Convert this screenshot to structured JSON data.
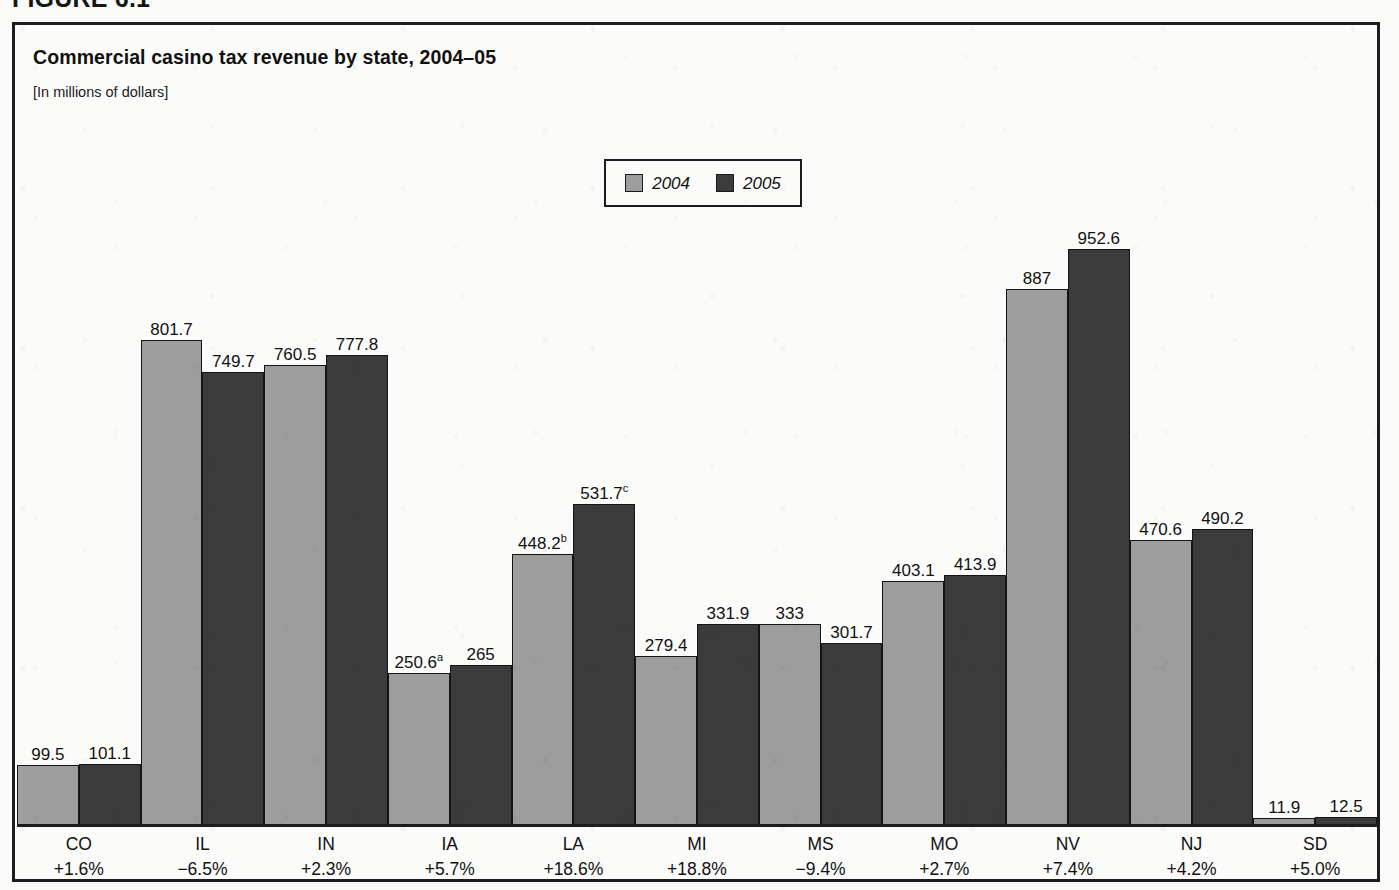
{
  "figure": {
    "label": "FIGURE 6.1"
  },
  "header": {
    "title": "Commercial casino tax revenue by state, 2004–05",
    "subtitle": "[In millions of dollars]"
  },
  "legend": {
    "entries": [
      {
        "label": "2004",
        "color": "#9d9d9d",
        "swatch_name": "legend-swatch-2004"
      },
      {
        "label": "2005",
        "color": "#3b3b3b",
        "swatch_name": "legend-swatch-2005"
      }
    ]
  },
  "chart_data": {
    "type": "bar",
    "title": "Commercial casino tax revenue by state, 2004–05",
    "subtitle": "[In millions of dollars]",
    "xlabel": "",
    "ylabel": "In millions of dollars",
    "ylim": [
      0,
      1000
    ],
    "grid": false,
    "legend_position": "top-center",
    "categories": [
      "CO",
      "IL",
      "IN",
      "IA",
      "LA",
      "MI",
      "MS",
      "MO",
      "NV",
      "NJ",
      "SD"
    ],
    "category_change": [
      "+1.6%",
      "−6.5%",
      "+2.3%",
      "+5.7%",
      "+18.6%",
      "+18.8%",
      "−9.4%",
      "+2.7%",
      "+7.4%",
      "+4.2%",
      "+5.0%"
    ],
    "series": [
      {
        "name": "2004",
        "color": "#9d9d9d",
        "values": [
          99.5,
          801.7,
          760.5,
          250.6,
          448.2,
          279.4,
          333,
          403.1,
          887,
          470.6,
          11.9
        ],
        "labels": [
          "99.5",
          "801.7",
          "760.5",
          "250.6",
          "448.2",
          "279.4",
          "333",
          "403.1",
          "887",
          "470.6",
          "11.9"
        ],
        "label_notes": [
          "",
          "",
          "",
          "a",
          "b",
          "",
          "",
          "",
          "",
          "",
          ""
        ]
      },
      {
        "name": "2005",
        "color": "#3b3b3b",
        "values": [
          101.1,
          749.7,
          777.8,
          265,
          531.7,
          331.9,
          301.7,
          413.9,
          952.6,
          490.2,
          12.5
        ],
        "labels": [
          "101.1",
          "749.7",
          "777.8",
          "265",
          "531.7",
          "331.9",
          "301.7",
          "413.9",
          "952.6",
          "490.2",
          "12.5"
        ],
        "label_notes": [
          "",
          "",
          "",
          "",
          "c",
          "",
          "",
          "",
          "",
          "",
          ""
        ]
      }
    ]
  }
}
